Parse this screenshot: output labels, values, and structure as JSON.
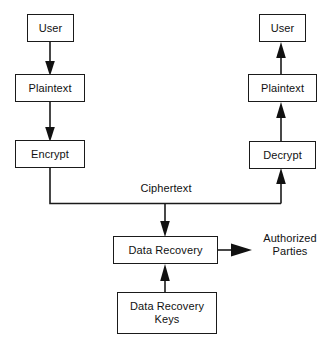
{
  "diagram": {
    "stroke_color": "#1a1a1a",
    "text_color": "#111111",
    "background_color": "#ffffff",
    "nodes": [
      {
        "id": "user_left",
        "label": "User",
        "x": 27,
        "y": 14,
        "w": 47,
        "h": 28
      },
      {
        "id": "plaintext_left",
        "label": "Plaintext",
        "x": 15,
        "y": 74,
        "w": 70,
        "h": 28
      },
      {
        "id": "encrypt",
        "label": "Encrypt",
        "x": 15,
        "y": 140,
        "w": 70,
        "h": 28
      },
      {
        "id": "user_right",
        "label": "User",
        "x": 259,
        "y": 14,
        "w": 47,
        "h": 28
      },
      {
        "id": "plaintext_right",
        "label": "Plaintext",
        "x": 248,
        "y": 74,
        "w": 69,
        "h": 28
      },
      {
        "id": "decrypt",
        "label": "Decrypt",
        "x": 249,
        "y": 141,
        "w": 67,
        "h": 28
      },
      {
        "id": "data_recovery",
        "label": "Data Recovery",
        "x": 113,
        "y": 236,
        "w": 105,
        "h": 28
      },
      {
        "id": "data_recovery_keys",
        "label": "Data Recovery\nKeys",
        "x": 117,
        "y": 292,
        "w": 100,
        "h": 42
      }
    ],
    "free_labels": [
      {
        "id": "ciphertext",
        "label": "Ciphertext",
        "x": 128,
        "y": 182,
        "w": 76
      },
      {
        "id": "authorized_parties",
        "label": "Authorized\nParties",
        "x": 253,
        "y": 232,
        "w": 74
      }
    ],
    "edges": [
      {
        "id": "user-left-to-plaintext",
        "from": "user_left",
        "to": "plaintext_left",
        "direction": "down"
      },
      {
        "id": "plaintext-to-encrypt",
        "from": "plaintext_left",
        "to": "encrypt",
        "direction": "down"
      },
      {
        "id": "encrypt-to-ciphertext-bus",
        "from": "encrypt",
        "to": "ciphertext_bus",
        "direction": "down-right"
      },
      {
        "id": "ciphertext-bus-to-decrypt",
        "from": "ciphertext_bus",
        "to": "decrypt",
        "direction": "up"
      },
      {
        "id": "ciphertext-bus-to-data-recovery",
        "from": "ciphertext_bus",
        "to": "data_recovery",
        "direction": "down"
      },
      {
        "id": "decrypt-to-plaintext-right",
        "from": "decrypt",
        "to": "plaintext_right",
        "direction": "up"
      },
      {
        "id": "plaintext-right-to-user-right",
        "from": "plaintext_right",
        "to": "user_right",
        "direction": "up"
      },
      {
        "id": "keys-to-data-recovery",
        "from": "data_recovery_keys",
        "to": "data_recovery",
        "direction": "up"
      },
      {
        "id": "data-recovery-to-authorized-parties",
        "from": "data_recovery",
        "to": "authorized_parties",
        "direction": "right"
      }
    ]
  }
}
